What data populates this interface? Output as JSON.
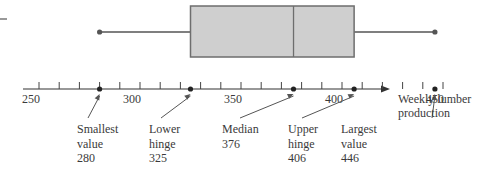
{
  "chart_data": {
    "type": "boxplot",
    "title": "",
    "xlabel": "Weekly lumber production",
    "ylabel": "",
    "xlim": [
      240,
      460
    ],
    "tick_step": 10,
    "tick_labels": [
      "250",
      "300",
      "350",
      "400",
      "450"
    ],
    "tick_label_values": [
      250,
      300,
      350,
      400,
      450
    ],
    "grid": false,
    "summary": {
      "min": 280,
      "lower_hinge": 325,
      "median": 376,
      "upper_hinge": 406,
      "max": 446
    },
    "annotations": [
      {
        "lines": [
          "Smallest",
          "value",
          "280"
        ],
        "value": 280
      },
      {
        "lines": [
          "Lower",
          "hinge",
          "325"
        ],
        "value": 325
      },
      {
        "lines": [
          "Median",
          "376"
        ],
        "value": 376
      },
      {
        "lines": [
          "Upper",
          "hinge",
          "406"
        ],
        "value": 406
      },
      {
        "lines": [
          "Largest",
          "value",
          "446"
        ],
        "value": 446
      }
    ],
    "axis_label_lines": [
      "Weekly lumber",
      "production"
    ],
    "colors": {
      "box_fill": "#cfcfcf",
      "box_stroke": "#6e6e6e",
      "line": "#555555"
    }
  }
}
